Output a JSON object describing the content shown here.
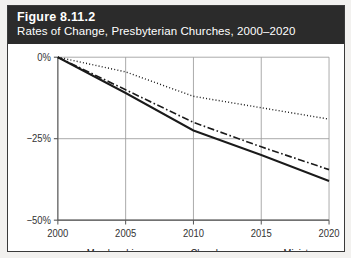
{
  "figure": {
    "number": "Figure 8.11.2",
    "subtitle": "Rates of Change, Presbyterian Churches, 2000–2020"
  },
  "colors": {
    "header_background": "#2b2b2b",
    "header_text": "#ffffff",
    "card_background": "#ffffff",
    "page_background": "#f2f1ef",
    "border": "#3a3a3a",
    "gridline": "#9a9a9a",
    "axis": "#555555",
    "series_line": "#1a1a1a",
    "tick_text": "#333333"
  },
  "chart_data": {
    "type": "line",
    "title": "Rates of Change, Presbyterian Churches, 2000–2020",
    "xlabel": "",
    "ylabel": "",
    "x": [
      2000,
      2005,
      2010,
      2015,
      2020
    ],
    "xlim": [
      2000,
      2020
    ],
    "ylim": [
      -50,
      0
    ],
    "xticks": [
      "2000",
      "2005",
      "2010",
      "2015",
      "2020"
    ],
    "yticks": [
      "0%",
      "−25%",
      "−50%"
    ],
    "ytick_values": [
      0,
      -25,
      -50
    ],
    "grid": true,
    "legend_position": "bottom",
    "series": [
      {
        "name": "Membership",
        "style": "solid",
        "values": [
          0,
          -11,
          -22.5,
          -30,
          -38
        ]
      },
      {
        "name": "Churches",
        "style": "dotted",
        "values": [
          0,
          -4.5,
          -12,
          -15.5,
          -19
        ]
      },
      {
        "name": "Ministers",
        "style": "dash-dot",
        "values": [
          0,
          -10,
          -20,
          -27.5,
          -34.5
        ]
      }
    ]
  }
}
